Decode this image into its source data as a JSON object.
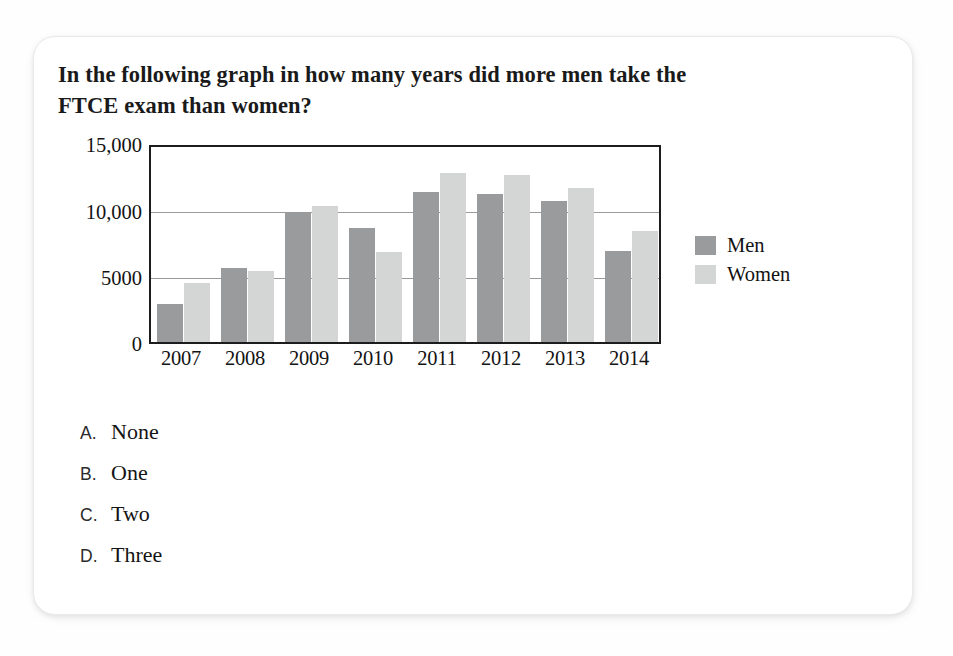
{
  "question": "In the following graph in how many years did more men take the FTCE exam than women?",
  "options": [
    {
      "letter": "A.",
      "text": "None"
    },
    {
      "letter": "B.",
      "text": "One"
    },
    {
      "letter": "C.",
      "text": "Two"
    },
    {
      "letter": "D.",
      "text": "Three"
    }
  ],
  "colors": {
    "men": "#9a9b9d",
    "women": "#d4d5d5",
    "axis": "#1c1c1c",
    "grid": "#9a9a9a"
  },
  "chart_data": {
    "type": "bar",
    "title": "",
    "xlabel": "",
    "ylabel": "",
    "categories": [
      "2007",
      "2008",
      "2009",
      "2010",
      "2011",
      "2012",
      "2013",
      "2014"
    ],
    "series": [
      {
        "name": "Men",
        "values": [
          2900,
          5700,
          9900,
          8700,
          11500,
          11300,
          10800,
          7000
        ]
      },
      {
        "name": "Women",
        "values": [
          4500,
          5400,
          10400,
          6900,
          12900,
          12800,
          11800,
          8500
        ]
      }
    ],
    "ylim": [
      0,
      15000
    ],
    "yticks": [
      0,
      5000,
      10000,
      15000
    ],
    "ytick_labels": [
      "0",
      "5000",
      "10,000",
      "15,000"
    ],
    "grid": true,
    "legend_position": "right"
  }
}
